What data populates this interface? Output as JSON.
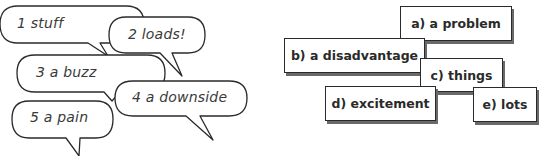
{
  "speech_bubbles": [
    {
      "number": "1",
      "label": "1 stuff"
    },
    {
      "number": "2",
      "label": "2 loads!"
    },
    {
      "number": "3",
      "label": "3 a buzz"
    },
    {
      "number": "4",
      "label": "4 a downside"
    },
    {
      "number": "5",
      "label": "5 a pain"
    }
  ],
  "answer_boxes": [
    {
      "letter": "a",
      "label": "a) a problem"
    },
    {
      "letter": "b",
      "label": "b) a disadvantage"
    },
    {
      "letter": "c",
      "label": "c) things"
    },
    {
      "letter": "d",
      "label": "d) excitement"
    },
    {
      "letter": "e",
      "label": "e) lots"
    }
  ],
  "colors": {
    "outline": "#2a2a2a",
    "shadow": "#6a6a6a",
    "text": "#3a3a3a",
    "background": "#ffffff"
  }
}
